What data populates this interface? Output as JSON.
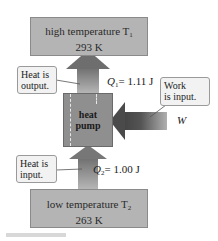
{
  "diagram": {
    "hot_reservoir": {
      "line1": "high temperature T",
      "subscript": "1",
      "temp": "293 K"
    },
    "cold_reservoir": {
      "line1": "low temperature T",
      "subscript": "2",
      "temp": "263 K"
    },
    "pump": {
      "line1": "heat",
      "line2": "pump"
    },
    "q1": {
      "symbol": "Q",
      "subscript": "1",
      "value": "= 1.11 J"
    },
    "q2": {
      "symbol": "Q",
      "subscript": "2",
      "value": "= 1.00 J"
    },
    "work": {
      "symbol": "W"
    },
    "callouts": {
      "heat_output": {
        "line1": "Heat is",
        "line2": "output."
      },
      "work_input": {
        "line1": "Work",
        "line2": "is input."
      },
      "heat_input": {
        "line1": "Heat is",
        "line2": "input."
      }
    },
    "colors": {
      "reservoir": "#b4b4b4",
      "pump": "#8f8f8f",
      "arrow_dark": "#6e6e6e",
      "arrow_light": "#b0b0b0",
      "callout_bg": "#f2f2f2"
    }
  }
}
